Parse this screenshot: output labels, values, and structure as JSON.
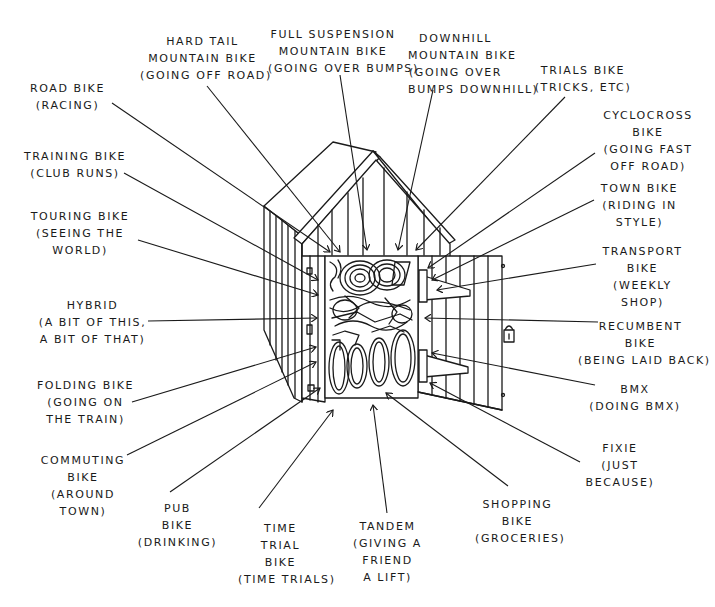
{
  "diagram": {
    "ink_color": "#1a1a1a",
    "background": "#ffffff",
    "labels": [
      {
        "id": "hard-tail",
        "name": "HARD TAIL\nMOUNTAIN BIKE",
        "desc": "(GOING OFF ROAD)",
        "x": 140,
        "y": 33,
        "w": 125
      },
      {
        "id": "full-suspension",
        "name": "FULL SUSPENSION\nMOUNTAIN BIKE",
        "desc": "(GOING OVER BUMPS)",
        "x": 268,
        "y": 26,
        "w": 130
      },
      {
        "id": "downhill",
        "name": "DOWNHILL\nMOUNTAIN BIKE",
        "desc": "(GOING OVER\nBUMPS DOWNHILL)",
        "x": 408,
        "y": 30,
        "w": 95
      },
      {
        "id": "road",
        "name": "ROAD BIKE",
        "desc": "(RACING)",
        "x": 25,
        "y": 80,
        "w": 85
      },
      {
        "id": "trials",
        "name": "TRIALS BIKE",
        "desc": "(TRICKS, ETC)",
        "x": 528,
        "y": 62,
        "w": 110
      },
      {
        "id": "cyclocross",
        "name": "CYCLOCROSS\nBIKE",
        "desc": "(GOING FAST\nOFF ROAD)",
        "x": 598,
        "y": 107,
        "w": 100
      },
      {
        "id": "training",
        "name": "TRAINING BIKE",
        "desc": "(CLUB RUNS)",
        "x": 20,
        "y": 148,
        "w": 110
      },
      {
        "id": "town",
        "name": "TOWN BIKE",
        "desc": "(RIDING IN\nSTYLE)",
        "x": 597,
        "y": 180,
        "w": 85
      },
      {
        "id": "touring",
        "name": "TOURING BIKE",
        "desc": "(SEEING THE\nWORLD)",
        "x": 25,
        "y": 208,
        "w": 110
      },
      {
        "id": "transport",
        "name": "TRANSPORT\nBIKE",
        "desc": "(WEEKLY\nSHOP)",
        "x": 600,
        "y": 243,
        "w": 85
      },
      {
        "id": "hybrid",
        "name": "HYBRID",
        "desc": "(A BIT OF THIS,\nA BIT OF THAT)",
        "x": 30,
        "y": 297,
        "w": 125
      },
      {
        "id": "recumbent",
        "name": "RECUMBENT\nBIKE",
        "desc": "(BEING LAID BACK)",
        "x": 578,
        "y": 318,
        "w": 125
      },
      {
        "id": "folding",
        "name": "FOLDING BIKE",
        "desc": "(GOING ON\nTHE TRAIN)",
        "x": 33,
        "y": 377,
        "w": 105
      },
      {
        "id": "bmx",
        "name": "BMX",
        "desc": "(DOING BMX)",
        "x": 585,
        "y": 381,
        "w": 100
      },
      {
        "id": "commuting",
        "name": "COMMUTING\nBIKE",
        "desc": "(AROUND\nTOWN)",
        "x": 38,
        "y": 452,
        "w": 90
      },
      {
        "id": "fixie",
        "name": "FIXIE",
        "desc": "(JUST\nBECAUSE)",
        "x": 580,
        "y": 440,
        "w": 80
      },
      {
        "id": "pub",
        "name": "PUB\nBIKE",
        "desc": "(DRINKING)",
        "x": 135,
        "y": 500,
        "w": 85
      },
      {
        "id": "time-trial",
        "name": "TIME\nTRIAL\nBIKE",
        "desc": "(TIME TRIALS)",
        "x": 238,
        "y": 520,
        "w": 85
      },
      {
        "id": "tandem",
        "name": "TANDEM",
        "desc": "(GIVING A\nFRIEND\nA LIFT)",
        "x": 345,
        "y": 518,
        "w": 85
      },
      {
        "id": "shopping",
        "name": "SHOPPING\nBIKE",
        "desc": "(GROCERIES)",
        "x": 475,
        "y": 496,
        "w": 85
      }
    ],
    "leader_lines": [
      {
        "for": "hard-tail",
        "x1": 207,
        "y1": 86,
        "x2": 340,
        "y2": 252
      },
      {
        "for": "full-suspension",
        "x1": 340,
        "y1": 75,
        "x2": 367,
        "y2": 250
      },
      {
        "for": "downhill",
        "x1": 433,
        "y1": 90,
        "x2": 398,
        "y2": 250
      },
      {
        "for": "road",
        "x1": 112,
        "y1": 103,
        "x2": 330,
        "y2": 252
      },
      {
        "for": "trials",
        "x1": 565,
        "y1": 97,
        "x2": 416,
        "y2": 250
      },
      {
        "for": "cyclocross",
        "x1": 595,
        "y1": 153,
        "x2": 428,
        "y2": 268
      },
      {
        "for": "training",
        "x1": 124,
        "y1": 173,
        "x2": 318,
        "y2": 280
      },
      {
        "for": "town",
        "x1": 594,
        "y1": 200,
        "x2": 432,
        "y2": 280
      },
      {
        "for": "touring",
        "x1": 138,
        "y1": 240,
        "x2": 318,
        "y2": 295
      },
      {
        "for": "transport",
        "x1": 596,
        "y1": 264,
        "x2": 437,
        "y2": 290
      },
      {
        "for": "hybrid",
        "x1": 148,
        "y1": 321,
        "x2": 317,
        "y2": 318
      },
      {
        "for": "recumbent",
        "x1": 598,
        "y1": 322,
        "x2": 425,
        "y2": 318
      },
      {
        "for": "folding",
        "x1": 132,
        "y1": 402,
        "x2": 316,
        "y2": 347
      },
      {
        "for": "bmx",
        "x1": 595,
        "y1": 385,
        "x2": 432,
        "y2": 353
      },
      {
        "for": "commuting",
        "x1": 127,
        "y1": 455,
        "x2": 316,
        "y2": 362
      },
      {
        "for": "fixie",
        "x1": 580,
        "y1": 462,
        "x2": 430,
        "y2": 383
      },
      {
        "for": "pub",
        "x1": 170,
        "y1": 492,
        "x2": 320,
        "y2": 388
      },
      {
        "for": "time-trial",
        "x1": 259,
        "y1": 508,
        "x2": 333,
        "y2": 410
      },
      {
        "for": "tandem",
        "x1": 387,
        "y1": 513,
        "x2": 373,
        "y2": 405
      },
      {
        "for": "shopping",
        "x1": 508,
        "y1": 486,
        "x2": 386,
        "y2": 393
      }
    ]
  }
}
